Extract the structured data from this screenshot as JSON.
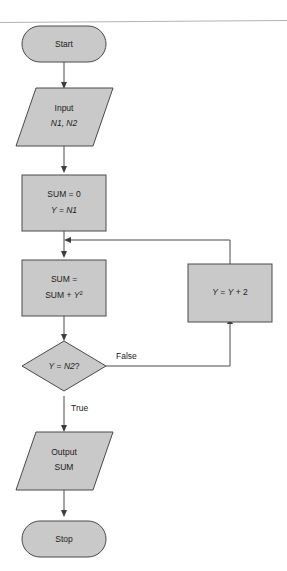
{
  "diagram": {
    "kind": "flowchart",
    "colors": {
      "shape_fill": "#c9c9c9",
      "shape_stroke": "#4a4a4a",
      "connector": "#4a4a4a",
      "text": "#1b1b1b",
      "rule": "#b4b4b4",
      "background": "#ffffff"
    },
    "nodes": [
      {
        "id": "start",
        "type": "terminator",
        "label": "Start",
        "lines": [
          "Start"
        ]
      },
      {
        "id": "input",
        "type": "input-output",
        "label": "Input N1, N2",
        "lines": [
          "Input",
          "N1, N2"
        ],
        "line1": "Input",
        "line2": "N1, N2"
      },
      {
        "id": "init",
        "type": "process",
        "label": "SUM = 0 ; Y = N1",
        "lines": [
          "SUM = 0",
          "Y = N1"
        ],
        "line1": "SUM = 0",
        "line2_var": "Y",
        "line2_eq": " = ",
        "line2_val": "N1"
      },
      {
        "id": "accumulate",
        "type": "process",
        "label": "SUM = SUM + Y2",
        "lines": [
          "SUM =",
          "SUM + Y2"
        ],
        "line1": "SUM =",
        "line2_pre": "SUM + ",
        "line2_var": "Y",
        "line2_exp": "2"
      },
      {
        "id": "increment",
        "type": "process",
        "label": "Y = Y + 2",
        "lines": [
          "Y = Y + 2"
        ],
        "var1": "Y",
        "mid": " = ",
        "var2": "Y",
        "tail": " + 2"
      },
      {
        "id": "decision",
        "type": "decision",
        "label": "Y = N2?",
        "lines": [
          "Y = N2?"
        ],
        "var1": "Y",
        "mid": " = ",
        "var2": "N2",
        "tail": "?"
      },
      {
        "id": "output",
        "type": "input-output",
        "label": "Output SUM",
        "lines": [
          "Output",
          "SUM"
        ],
        "line1": "Output",
        "line2": "SUM"
      },
      {
        "id": "stop",
        "type": "terminator",
        "label": "Stop",
        "lines": [
          "Stop"
        ]
      }
    ],
    "edges": [
      {
        "id": "start-input",
        "from": "start",
        "to": "input",
        "label": ""
      },
      {
        "id": "input-init",
        "from": "input",
        "to": "init",
        "label": ""
      },
      {
        "id": "init-accumulate",
        "from": "init",
        "to": "accumulate",
        "label": ""
      },
      {
        "id": "accumulate-decision",
        "from": "accumulate",
        "to": "decision",
        "label": ""
      },
      {
        "id": "decision-increment",
        "from": "decision",
        "to": "increment",
        "label": "False"
      },
      {
        "id": "increment-loopback",
        "from": "increment",
        "to": "accumulate",
        "label": ""
      },
      {
        "id": "decision-output",
        "from": "decision",
        "to": "output",
        "label": "True"
      },
      {
        "id": "output-stop",
        "from": "output",
        "to": "stop",
        "label": ""
      }
    ],
    "edge_labels": {
      "false": "False",
      "true": "True"
    }
  }
}
